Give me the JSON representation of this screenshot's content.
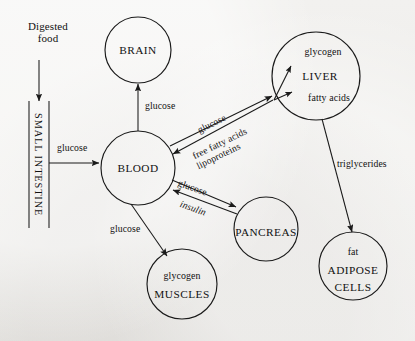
{
  "diagram": {
    "background_color": "#efeeec",
    "ink_color": "#1a1a1a"
  },
  "source": {
    "label_line1": "Digested",
    "label_line2": "food",
    "conduit_label": "SMALL INTESTINE"
  },
  "nodes": {
    "brain": {
      "name": "BRAIN"
    },
    "blood": {
      "name": "BLOOD"
    },
    "liver": {
      "name": "LIVER",
      "top_store": "glycogen",
      "bottom_store": "fatty acids"
    },
    "pancreas": {
      "name": "PANCREAS"
    },
    "muscles": {
      "name": "MUSCLES",
      "store": "glycogen"
    },
    "adipose": {
      "name_line1": "ADIPOSE",
      "name_line2": "CELLS",
      "store": "fat"
    }
  },
  "edges": {
    "intestine_to_blood": {
      "label": "glucose"
    },
    "blood_to_brain": {
      "label": "glucose"
    },
    "blood_to_liver": {
      "label": "glucose"
    },
    "liver_to_blood_line1": {
      "label": "free fatty acids"
    },
    "liver_to_blood_line2": {
      "label": "lipoproteins"
    },
    "blood_to_pancreas": {
      "label": "glucose"
    },
    "pancreas_to_blood": {
      "label": "insulin"
    },
    "blood_to_muscles": {
      "label": "glucose"
    },
    "liver_to_adipose": {
      "label": "triglycerides"
    }
  }
}
